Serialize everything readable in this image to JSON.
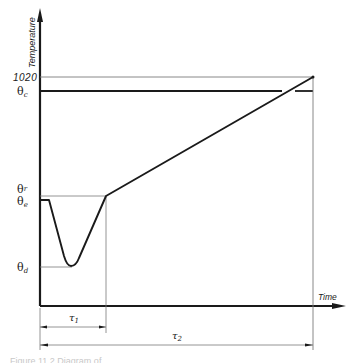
{
  "diagram": {
    "y_axis_label": "Temperature",
    "x_axis_label": "Time",
    "levels": {
      "top_value": "1020",
      "theta_c": "θ",
      "theta_c_sub": "c",
      "theta_r": "θ",
      "theta_r_sub": "r",
      "theta_e": "θ",
      "theta_e_sub": "e",
      "theta_d": "θ",
      "theta_d_sub": "d"
    },
    "intervals": {
      "tau1": "τ",
      "tau1_sub": "1",
      "tau2": "τ",
      "tau2_sub": "2"
    },
    "caption": "Figure 11.2 Diagram of ..."
  },
  "colors": {
    "ink": "#1a1a1a",
    "thin_line": "#7a7a7a",
    "background": "#ffffff"
  }
}
